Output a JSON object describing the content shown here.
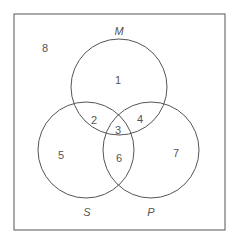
{
  "diagram": {
    "type": "venn",
    "sets": [
      {
        "name": "M",
        "cx": 119,
        "cy": 87,
        "r": 48,
        "label_x": 119,
        "label_y": 31
      },
      {
        "name": "S",
        "cx": 86,
        "cy": 150,
        "r": 48,
        "label_x": 87,
        "label_y": 212
      },
      {
        "name": "P",
        "cx": 151,
        "cy": 150,
        "r": 48,
        "label_x": 151,
        "label_y": 212
      }
    ],
    "regions": [
      {
        "id": "1",
        "x": 118,
        "y": 80
      },
      {
        "id": "2",
        "x": 94,
        "y": 120
      },
      {
        "id": "3",
        "x": 118,
        "y": 130
      },
      {
        "id": "4",
        "x": 140,
        "y": 119
      },
      {
        "id": "5",
        "x": 61,
        "y": 155
      },
      {
        "id": "6",
        "x": 119,
        "y": 158
      },
      {
        "id": "7",
        "x": 176,
        "y": 153
      },
      {
        "id": "8",
        "x": 45,
        "y": 48
      }
    ],
    "stroke_color": "#555555",
    "frame": {
      "x": 14,
      "y": 14,
      "w": 211,
      "h": 216
    }
  }
}
